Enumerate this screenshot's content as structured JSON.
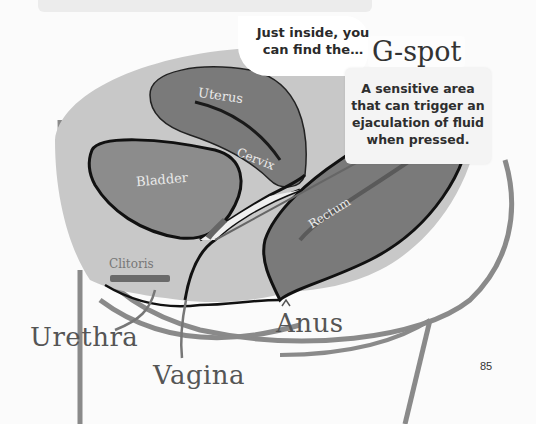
{
  "page": {
    "page_number": "85"
  },
  "callout": {
    "intro_text": "Just inside, you can find the…",
    "title": "G-spot",
    "description": "A sensitive area that can trigger an ejaculation of fluid when pressed."
  },
  "organ_labels": {
    "uterus": "Uterus",
    "cervix": "Cervix",
    "bladder": "Bladder",
    "rectum": "Rectum",
    "clitoris": "Clitoris"
  },
  "external_labels": {
    "urethra": "Urethra",
    "vagina": "Vagina",
    "anus": "Anus"
  },
  "colors": {
    "body_fill": "#c8c8c8",
    "organ_fill": "#7a7a7a",
    "bladder_fill": "#8c8c8c",
    "outline": "#1a1a1a",
    "silhouette_line": "#8a8a8a",
    "background": "#fbfbfb"
  }
}
